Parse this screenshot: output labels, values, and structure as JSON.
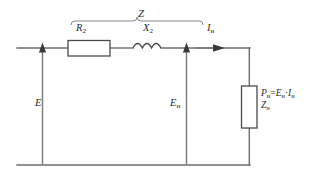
{
  "diagram": {
    "labels": {
      "impedance_total": "Z",
      "resistance": "R",
      "resistance_sub": "2",
      "reactance": "X",
      "reactance_sub": "2",
      "current": "I",
      "current_sub": "н",
      "emf": "E",
      "load_voltage": "E",
      "load_voltage_sub": "н",
      "power_symbol": "P",
      "power_sub": "н",
      "power_equals": "=",
      "power_rhs_e": "E",
      "power_rhs_e_sub": "н",
      "power_dot": "·",
      "power_rhs_i": "I",
      "power_rhs_i_sub": "н",
      "load_impedance": "Z",
      "load_impedance_sub": "н"
    },
    "components": [
      {
        "name": "resistor-r2",
        "type": "resistor",
        "label": "R2",
        "orientation": "horizontal"
      },
      {
        "name": "inductor-x2",
        "type": "inductor",
        "label": "X2",
        "orientation": "horizontal"
      },
      {
        "name": "load-zn",
        "type": "resistor",
        "label": "Zн",
        "orientation": "vertical"
      }
    ],
    "arrows": [
      {
        "name": "emf-arrow",
        "label": "E",
        "direction": "up"
      },
      {
        "name": "load-voltage-arrow",
        "label": "Eн",
        "direction": "up"
      },
      {
        "name": "current-arrow",
        "label": "Iн",
        "direction": "right"
      }
    ],
    "colors": {
      "wire": "#6e6e6e",
      "component_stroke": "#4a4a4a",
      "text": "#2b2b2b",
      "background": "#ffffff",
      "brace": "#8a8a8a"
    }
  }
}
